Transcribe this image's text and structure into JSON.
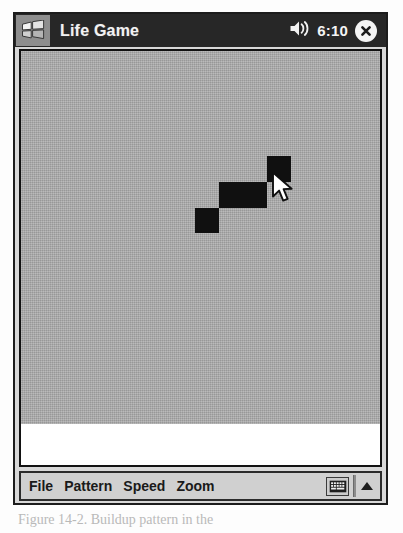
{
  "window": {
    "title": "Life Game",
    "start_icon": "windows-flag-icon",
    "close_icon": "close-icon"
  },
  "statusbar": {
    "volume_icon": "speaker-icon",
    "clock": "6:10"
  },
  "board": {
    "background_color": "#a9a9a9",
    "cell_color": "#101010",
    "cell_size": 24,
    "live_cells": [
      {
        "x": 246,
        "y": 105,
        "w": 24,
        "h": 26
      },
      {
        "x": 198,
        "y": 131,
        "w": 48,
        "h": 26
      },
      {
        "x": 174,
        "y": 157,
        "w": 24,
        "h": 25
      }
    ],
    "cursor": {
      "x": 250,
      "y": 120,
      "icon": "arrow-pointer-icon"
    }
  },
  "menu": {
    "items": [
      {
        "label": "File"
      },
      {
        "label": "Pattern"
      },
      {
        "label": "Speed"
      },
      {
        "label": "Zoom"
      }
    ],
    "sip_icon": "keyboard-icon",
    "sip_arrow_icon": "chevron-up-icon"
  },
  "caption": {
    "text": "Figure 14-2.  Buildup pattern in the"
  }
}
